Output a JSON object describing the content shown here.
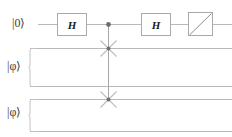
{
  "diagram": {
    "type": "quantum-circuit",
    "name": "swap-test-circuit",
    "width": 232,
    "height": 137,
    "background_color": "#ffffff"
  },
  "colors": {
    "wire": "#b9b9b9",
    "gate_border": "#a9a9a9",
    "gate_fill": "#ffffff",
    "gate_text": "#1a1a1a",
    "control_dot": "#6e6e6e",
    "swap_cross": "#bdbdbd",
    "brace": "#c3c3c3",
    "label_text": "#3c3c3c"
  },
  "registers": [
    {
      "id": "ancilla",
      "label": "|0⟩",
      "wire_count": 1,
      "has_brace": false,
      "y": 24
    },
    {
      "id": "phi-1",
      "label": "|φ⟩",
      "wire_count": 2,
      "has_brace": true,
      "y": 67
    },
    {
      "id": "phi-2",
      "label": "|φ⟩",
      "wire_count": 2,
      "has_brace": true,
      "y": 112
    }
  ],
  "wires": [
    {
      "id": "wire-ancilla",
      "y": 24,
      "x1": 38,
      "x2": 232
    },
    {
      "id": "wire-phi1-a",
      "y": 48,
      "x1": 30,
      "x2": 232
    },
    {
      "id": "wire-phi1-b",
      "y": 86,
      "x1": 30,
      "x2": 232
    },
    {
      "id": "wire-phi2-a",
      "y": 99,
      "x1": 30,
      "x2": 232
    },
    {
      "id": "wire-phi2-b",
      "y": 131,
      "x1": 30,
      "x2": 232
    }
  ],
  "gates": [
    {
      "id": "hadamard-1",
      "kind": "box",
      "label": "H",
      "x": 57,
      "y": 13,
      "width": 29,
      "height": 22
    },
    {
      "id": "hadamard-2",
      "kind": "box",
      "label": "H",
      "x": 141,
      "y": 13,
      "width": 29,
      "height": 22
    },
    {
      "id": "measurement",
      "kind": "measure",
      "label": "",
      "x": 188,
      "y": 12,
      "width": 24,
      "height": 23
    }
  ],
  "controlled_swap": {
    "id": "controlled-swap",
    "control_x": 108,
    "control_y": 24,
    "control_radius": 2.3,
    "line_from_y": 24,
    "line_to_y": 99,
    "targets": [
      {
        "id": "swap-target-1",
        "x": 108,
        "y": 48,
        "arm": 11
      },
      {
        "id": "swap-target-2",
        "x": 108,
        "y": 99,
        "arm": 11
      }
    ]
  },
  "braces": [
    {
      "id": "brace-phi-1",
      "x": 30,
      "y_top": 48,
      "y_bottom": 86,
      "depth": 6
    },
    {
      "id": "brace-phi-2",
      "x": 30,
      "y_top": 99,
      "y_bottom": 131,
      "depth": 6
    }
  ],
  "labels": {
    "ancilla": {
      "text": "|0⟩",
      "left": 12,
      "top": 17
    },
    "phi_first": {
      "text": "|φ⟩",
      "left": 7,
      "top": 60
    },
    "phi_second": {
      "text": "|φ⟩",
      "left": 7,
      "top": 106
    }
  }
}
